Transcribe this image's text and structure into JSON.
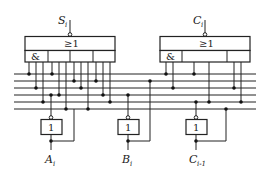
{
  "diagram": {
    "type": "logic-circuit",
    "inputs": {
      "top_left": {
        "label": "S",
        "subscript": "i"
      },
      "top_right": {
        "label": "C",
        "subscript": "i"
      }
    },
    "outputs": [
      {
        "label": "A",
        "subscript": "i"
      },
      {
        "label": "B",
        "subscript": "i"
      },
      {
        "label": "C",
        "subscript": "i-1"
      }
    ],
    "gates": {
      "aoi_left": {
        "or_symbol": "≥1",
        "and_symbol": "&",
        "cells": 4
      },
      "aoi_right": {
        "or_symbol": "≥1",
        "and_symbol": "&",
        "cells": 3
      },
      "inverters": [
        {
          "symbol": "1",
          "output": "A_i"
        },
        {
          "symbol": "1",
          "output": "B_i"
        },
        {
          "symbol": "1",
          "output": "C_i-1"
        }
      ]
    },
    "bus_lines": 6
  }
}
